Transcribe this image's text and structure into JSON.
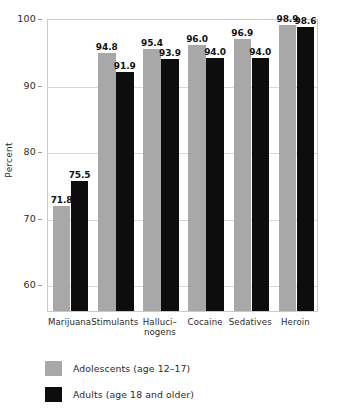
{
  "chart_data": {
    "type": "bar",
    "title": "",
    "subtitle": "",
    "xlabel": "",
    "ylabel": "Percent",
    "ylim": [
      56,
      100
    ],
    "yticks": [
      60,
      70,
      80,
      90,
      100
    ],
    "ytick_labels": [
      "60",
      "70",
      "80",
      "90",
      "100"
    ],
    "grid": true,
    "legend_position": "bottom-left",
    "categories": [
      "Marijuana",
      "Stimulants",
      "Halluci–nogens",
      "Cocaine",
      "Sedatives",
      "Heroin"
    ],
    "category_lines": [
      [
        "Marijuana"
      ],
      [
        "Stimulants"
      ],
      [
        "Halluci–",
        "nogens"
      ],
      [
        "Cocaine"
      ],
      [
        "Sedatives"
      ],
      [
        "Heroin"
      ]
    ],
    "series": [
      {
        "name": "Adolescents (age 12–17)",
        "color": "#a8a8a8",
        "values": [
          71.8,
          94.8,
          95.4,
          96.0,
          96.9,
          98.9
        ],
        "value_labels": [
          "71.8",
          "94.8",
          "95.4",
          "96.0",
          "96.9",
          "98.9"
        ]
      },
      {
        "name": "Adults (age 18 and older)",
        "color": "#0d0d0d",
        "values": [
          75.5,
          91.9,
          93.9,
          94.0,
          94.0,
          98.6
        ],
        "value_labels": [
          "75.5",
          "91.9",
          "93.9",
          "94.0",
          "94.0",
          "98.6"
        ]
      }
    ]
  },
  "legend": {
    "items": [
      {
        "label": "Adolescents (age 12–17)",
        "color": "#a8a8a8"
      },
      {
        "label": "Adults (age 18 and older)",
        "color": "#0d0d0d"
      }
    ]
  },
  "axes": {
    "y_title": "Percent"
  },
  "crop_remnant": ""
}
